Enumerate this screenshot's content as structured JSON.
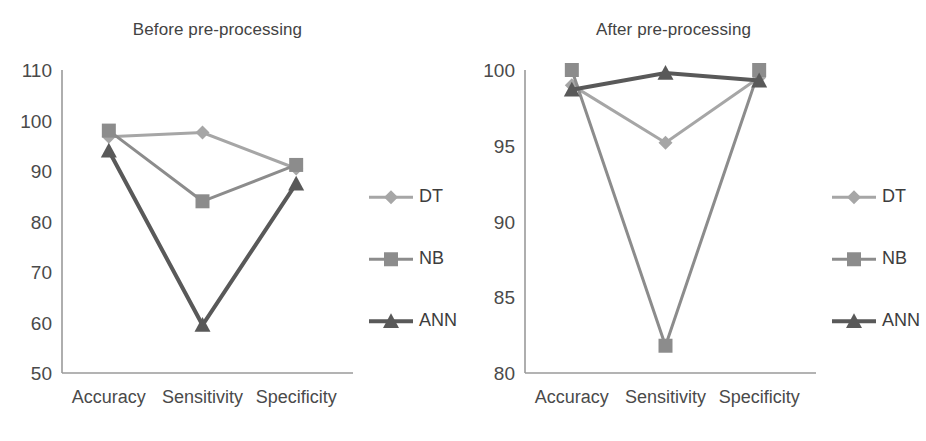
{
  "figure": {
    "background": "#ffffff",
    "axis_color": "#9a9a9a",
    "text_color": "#4a4a4a"
  },
  "series_styles": {
    "DT": {
      "color": "#a6a6a6",
      "marker": "diamond",
      "line_width": 3
    },
    "NB": {
      "color": "#8c8c8c",
      "marker": "square",
      "line_width": 3
    },
    "ANN": {
      "color": "#595959",
      "marker": "triangle",
      "line_width": 4
    }
  },
  "legend": {
    "position": "right",
    "entries": [
      {
        "label": "DT",
        "marker": "diamond",
        "color": "#a6a6a6"
      },
      {
        "label": "NB",
        "marker": "square",
        "color": "#8c8c8c"
      },
      {
        "label": "ANN",
        "marker": "triangle",
        "color": "#595959"
      }
    ]
  },
  "chart_data": [
    {
      "id": "before",
      "type": "line",
      "title": "Before pre-processing",
      "xlabel": "",
      "ylabel": "",
      "categories": [
        "Accuracy",
        "Sensitivity",
        "Specificity"
      ],
      "ylim": [
        50,
        110
      ],
      "yticks": [
        50,
        60,
        70,
        80,
        90,
        100,
        110
      ],
      "grid": false,
      "legend_position": "right",
      "series": [
        {
          "name": "DT",
          "values": [
            96.8,
            97.6,
            90.5
          ]
        },
        {
          "name": "NB",
          "values": [
            98.0,
            84.0,
            91.2
          ]
        },
        {
          "name": "ANN",
          "values": [
            94.0,
            59.5,
            87.5
          ]
        }
      ]
    },
    {
      "id": "after",
      "type": "line",
      "title": "After pre-processing",
      "xlabel": "",
      "ylabel": "",
      "categories": [
        "Accuracy",
        "Sensitivity",
        "Specificity"
      ],
      "ylim": [
        80,
        100
      ],
      "yticks": [
        80,
        85,
        90,
        95,
        100
      ],
      "grid": false,
      "legend_position": "right",
      "series": [
        {
          "name": "DT",
          "values": [
            99.0,
            95.2,
            99.5
          ]
        },
        {
          "name": "NB",
          "values": [
            100.0,
            81.8,
            100.0
          ]
        },
        {
          "name": "ANN",
          "values": [
            98.7,
            99.8,
            99.3
          ]
        }
      ]
    }
  ]
}
